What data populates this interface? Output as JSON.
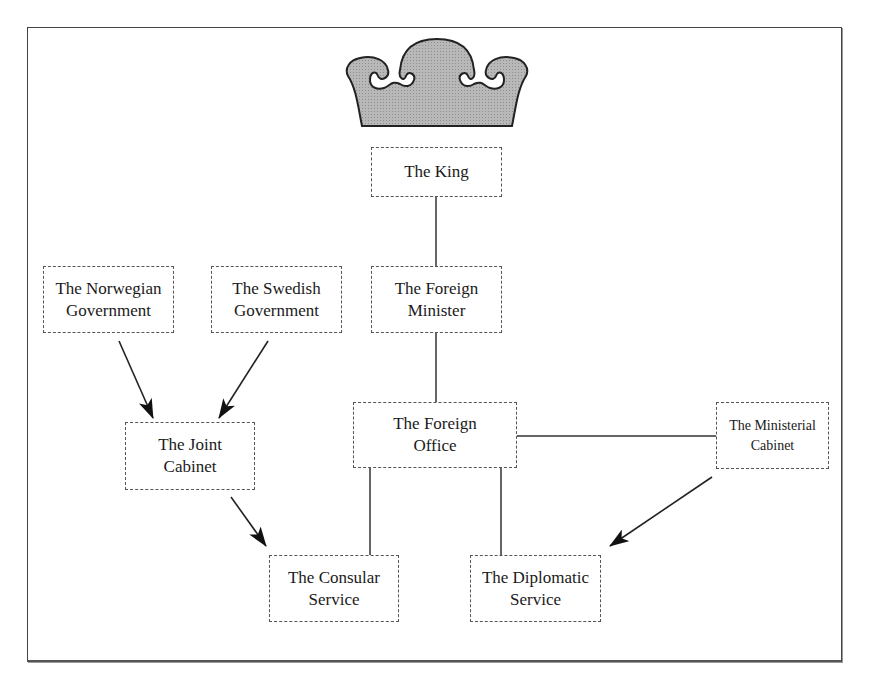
{
  "figure": {
    "header_cutoff_text": "Figure 2. The organisation",
    "crown_icon": "crown-icon",
    "colors": {
      "crown_fill": "#b3b3b3",
      "line": "#333333",
      "box_border": "#555555",
      "background": "#ffffff"
    }
  },
  "nodes": {
    "king": {
      "line1": "The King",
      "line2": ""
    },
    "foreign_minister": {
      "line1": "The Foreign",
      "line2": "Minister"
    },
    "norwegian_government": {
      "line1": "The Norwegian",
      "line2": "Government"
    },
    "swedish_government": {
      "line1": "The Swedish",
      "line2": "Government"
    },
    "joint_cabinet": {
      "line1": "The Joint",
      "line2": "Cabinet"
    },
    "foreign_office": {
      "line1": "The Foreign",
      "line2": "Office"
    },
    "ministerial_cabinet": {
      "line1": "The Ministerial",
      "line2": "Cabinet"
    },
    "consular_service": {
      "line1": "The Consular",
      "line2": "Service"
    },
    "diplomatic_service": {
      "line1": "The Diplomatic",
      "line2": "Service"
    }
  },
  "edges": [
    {
      "from": "king",
      "to": "foreign_minister",
      "type": "line"
    },
    {
      "from": "foreign_minister",
      "to": "foreign_office",
      "type": "line"
    },
    {
      "from": "foreign_office",
      "to": "ministerial_cabinet",
      "type": "line"
    },
    {
      "from": "foreign_office",
      "to": "consular_service",
      "type": "line"
    },
    {
      "from": "foreign_office",
      "to": "diplomatic_service",
      "type": "line"
    },
    {
      "from": "norwegian_government",
      "to": "joint_cabinet",
      "type": "arrow"
    },
    {
      "from": "swedish_government",
      "to": "joint_cabinet",
      "type": "arrow"
    },
    {
      "from": "joint_cabinet",
      "to": "consular_service",
      "type": "arrow"
    },
    {
      "from": "ministerial_cabinet",
      "to": "diplomatic_service",
      "type": "arrow"
    }
  ]
}
